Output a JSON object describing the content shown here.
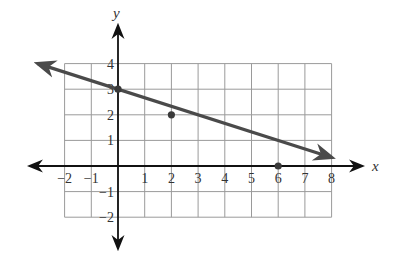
{
  "chart_data": {
    "type": "line",
    "title": "",
    "xlabel": "x",
    "ylabel": "y",
    "xlim": [
      -2,
      8
    ],
    "ylim": [
      -2,
      4
    ],
    "grid": true,
    "x_ticks": [
      -2,
      -1,
      1,
      2,
      3,
      4,
      5,
      6,
      7,
      8
    ],
    "y_ticks": [
      4,
      3,
      2,
      1,
      -1,
      -2
    ],
    "x_tick_labels": [
      "−2",
      "−1",
      "1",
      "2",
      "3",
      "4",
      "5",
      "6",
      "7",
      "8"
    ],
    "y_tick_labels": [
      "4",
      "3",
      "2",
      "1",
      "−1",
      "−2"
    ],
    "series": [
      {
        "name": "line",
        "equation": "y = -x/3 + 3",
        "slope": -0.3333,
        "intercept": 3,
        "x_range": [
          -3,
          8
        ],
        "arrows_both_ends": true,
        "points": [
          {
            "x": 0,
            "y": 3
          },
          {
            "x": 2,
            "y": 2
          },
          {
            "x": 6,
            "y": 0
          }
        ]
      }
    ],
    "colors": {
      "grid": "#9a9a9a",
      "axis": "#111111",
      "line": "#4a4a4a",
      "point": "#3a3a3a"
    }
  }
}
